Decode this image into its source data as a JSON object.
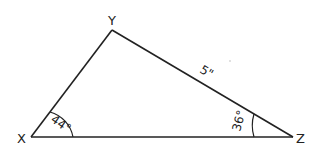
{
  "diagram": {
    "type": "triangle",
    "vertices": {
      "X": {
        "label": "X"
      },
      "Y": {
        "label": "Y"
      },
      "Z": {
        "label": "Z"
      }
    },
    "angles": {
      "X": {
        "label": "44°",
        "value": 44
      },
      "Z": {
        "label": "36°",
        "value": 36
      }
    },
    "sides": {
      "YZ": {
        "label": "5\"",
        "length": 5,
        "unit": "inches"
      }
    },
    "colors": {
      "stroke": "#222222",
      "background": "#ffffff"
    }
  }
}
